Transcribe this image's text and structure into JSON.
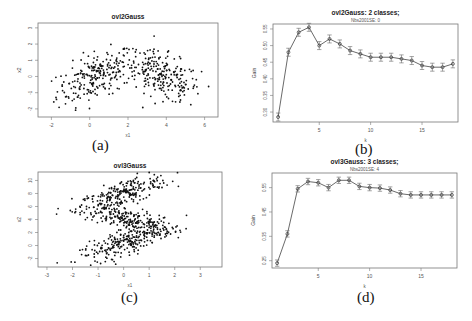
{
  "captions": [
    "(a)",
    "(b)",
    "(c)",
    "(d)"
  ],
  "chart_data": [
    {
      "type": "scatter",
      "panel": "a",
      "title": "ovl2Gauss",
      "xlabel": "x1",
      "ylabel": "x2",
      "xlim": [
        -2.7,
        6.7
      ],
      "ylim": [
        -2.5,
        3.3
      ],
      "xticks": [
        -2,
        0,
        2,
        4,
        6
      ],
      "yticks": [
        -2,
        -1,
        0,
        1,
        2,
        3
      ],
      "clusters": [
        {
          "cx": 0.3,
          "cy": 0.0,
          "sx": 1.0,
          "sy": 0.7,
          "n": 230,
          "slope": 0.45
        },
        {
          "cx": 3.8,
          "cy": 0.0,
          "sx": 1.0,
          "sy": 0.7,
          "n": 230,
          "slope": -0.45
        }
      ],
      "frame": {
        "x0": 38,
        "y0": 23,
        "x1": 218,
        "y1": 117
      }
    },
    {
      "type": "line",
      "panel": "b",
      "title": "ovl2Gauss: 2 classes;",
      "subtitle": "Nbs2001SE: 0",
      "xlabel": "k",
      "ylabel": "Gain",
      "xlim": [
        0.5,
        18.5
      ],
      "ylim": [
        0.27,
        0.565
      ],
      "xticks": [
        5,
        10,
        15
      ],
      "yticks": [
        0.3,
        0.35,
        0.4,
        0.45,
        0.5,
        0.55
      ],
      "x": [
        1,
        2,
        3,
        4,
        5,
        6,
        7,
        8,
        9,
        10,
        11,
        12,
        13,
        14,
        15,
        16,
        17,
        18
      ],
      "values": [
        0.285,
        0.48,
        0.54,
        0.555,
        0.5,
        0.52,
        0.505,
        0.485,
        0.475,
        0.465,
        0.465,
        0.465,
        0.46,
        0.455,
        0.44,
        0.435,
        0.435,
        0.445
      ],
      "error": 0.012,
      "frame": {
        "x0": 273,
        "y0": 24,
        "x1": 458,
        "y1": 122
      }
    },
    {
      "type": "scatter",
      "panel": "c",
      "title": "ovl3Gauss",
      "xlabel": "x1",
      "ylabel": "x2",
      "xlim": [
        -3.35,
        3.85
      ],
      "ylim": [
        -3.3,
        11.3
      ],
      "xticks": [
        -3,
        -2,
        -1,
        0,
        1,
        2,
        3
      ],
      "yticks": [
        -2,
        0,
        2,
        4,
        6,
        8,
        10
      ],
      "clusters": [
        {
          "cx": 0.0,
          "cy": 8.0,
          "sx": 0.9,
          "sy": 1.0,
          "n": 230,
          "slope": 1.3
        },
        {
          "cx": 0.2,
          "cy": 4.0,
          "sx": 0.85,
          "sy": 0.9,
          "n": 230,
          "slope": -1.0
        },
        {
          "cx": 0.1,
          "cy": 0.5,
          "sx": 0.9,
          "sy": 0.9,
          "n": 230,
          "slope": 1.3
        }
      ],
      "frame": {
        "x0": 38,
        "y0": 172,
        "x1": 222,
        "y1": 267
      }
    },
    {
      "type": "line",
      "panel": "d",
      "title": "ovl3Gauss: 3 classes;",
      "subtitle": "Nbs2001SE: 4",
      "xlabel": "k",
      "ylabel": "Gain",
      "xlim": [
        0.5,
        18.5
      ],
      "ylim": [
        0.22,
        0.61
      ],
      "xticks": [
        5,
        10,
        15
      ],
      "yticks": [
        0.25,
        0.35,
        0.45,
        0.55
      ],
      "x": [
        1,
        2,
        3,
        4,
        5,
        6,
        7,
        8,
        9,
        10,
        11,
        12,
        13,
        14,
        15,
        16,
        17,
        18
      ],
      "values": [
        0.24,
        0.36,
        0.545,
        0.575,
        0.57,
        0.55,
        0.58,
        0.58,
        0.555,
        0.55,
        0.548,
        0.54,
        0.525,
        0.52,
        0.52,
        0.52,
        0.52,
        0.52
      ],
      "error": 0.013,
      "frame": {
        "x0": 272,
        "y0": 173,
        "x1": 457,
        "y1": 268
      }
    }
  ]
}
